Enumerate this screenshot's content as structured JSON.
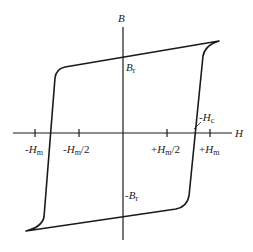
{
  "diagram": {
    "axes": {
      "x_label": "H",
      "y_label": "B"
    },
    "x_ticks": [
      {
        "sign": "-",
        "sym": "H",
        "sub": "m",
        "suffix": ""
      },
      {
        "sign": "-",
        "sym": "H",
        "sub": "m",
        "suffix": "/2"
      },
      {
        "sign": "+",
        "sym": "H",
        "sub": "m",
        "suffix": "/2"
      },
      {
        "sign": "+",
        "sym": "H",
        "sub": "m",
        "suffix": ""
      }
    ],
    "annotations": {
      "remanence_pos": {
        "sign": "",
        "sym": "B",
        "sub": "r"
      },
      "remanence_neg": {
        "sign": "-",
        "sym": "B",
        "sub": "r"
      },
      "coercivity": {
        "sign": "-",
        "sym": "H",
        "sub": "c"
      }
    },
    "colors": {
      "line": "#1a1a1a",
      "background": "#ffffff"
    }
  }
}
